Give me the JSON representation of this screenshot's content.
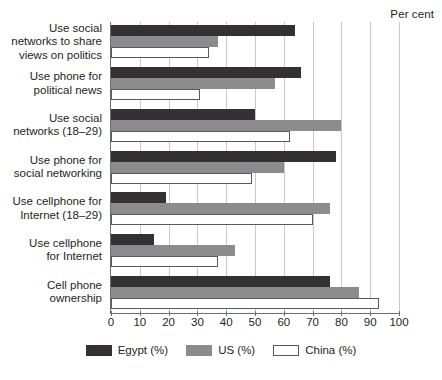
{
  "axis_note": "Per cent",
  "chart_data": {
    "type": "bar",
    "orientation": "horizontal",
    "title": "",
    "subtitle": "",
    "xlabel": "Per cent",
    "ylabel": "",
    "xlim": [
      0,
      100
    ],
    "xticks": [
      0,
      10,
      20,
      30,
      40,
      50,
      60,
      70,
      80,
      90,
      100
    ],
    "xtick_labels": [
      "0",
      "10",
      "20",
      "30",
      "40",
      "50",
      "60",
      "70",
      "80",
      "90",
      "100"
    ],
    "grid": true,
    "legend_position": "bottom",
    "categories": [
      "Use social networks to share views on politics",
      "Use phone for political news",
      "Use social networks (18–29)",
      "Use phone for social networking",
      "Use cellphone for Internet (18–29)",
      "Use cellphone for Internet",
      "Cell phone ownership"
    ],
    "category_lines": [
      [
        "Use social",
        "networks to share",
        "views on politics"
      ],
      [
        "Use phone for",
        "political news"
      ],
      [
        "Use social",
        "networks (18–29)"
      ],
      [
        "Use phone for",
        "social networking"
      ],
      [
        "Use cellphone for",
        "Internet (18–29)"
      ],
      [
        "Use cellphone",
        "for Internet"
      ],
      [
        "Cell phone",
        "ownership"
      ]
    ],
    "series": [
      {
        "name": "Egypt (%)",
        "color": "#333132",
        "values": [
          64,
          66,
          50,
          78,
          19,
          15,
          76
        ]
      },
      {
        "name": "US (%)",
        "color": "#8c8c8e",
        "values": [
          37,
          57,
          80,
          60,
          76,
          43,
          86
        ]
      },
      {
        "name": "China (%)",
        "color": "#ffffff",
        "values": [
          34,
          31,
          62,
          49,
          70,
          37,
          93
        ]
      }
    ]
  },
  "legend": {
    "items": [
      {
        "label": "Egypt (%)",
        "swatch": "egypt"
      },
      {
        "label": "US (%)",
        "swatch": "us"
      },
      {
        "label": "China (%)",
        "swatch": "china"
      }
    ]
  }
}
